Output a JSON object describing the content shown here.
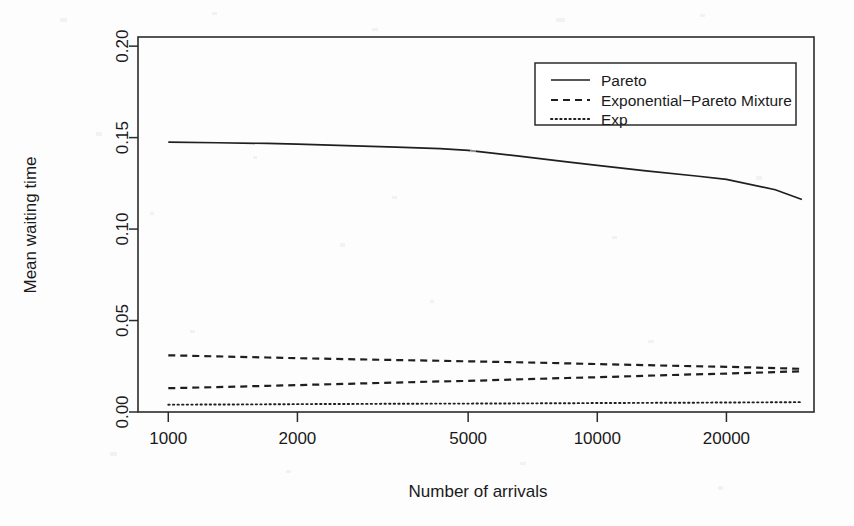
{
  "chart_data": {
    "type": "line",
    "title": "",
    "xlabel": "Number of arrivals",
    "ylabel": "Mean waiting time",
    "xscale": "log",
    "yscale": "linear",
    "xlim": [
      850,
      32000
    ],
    "ylim": [
      0.0,
      0.205
    ],
    "xticks": [
      1000,
      2000,
      5000,
      10000,
      20000
    ],
    "xtick_labels": [
      "1000",
      "2000",
      "5000",
      "10000",
      "20000"
    ],
    "yticks": [
      0.0,
      0.05,
      0.1,
      0.15,
      0.2
    ],
    "ytick_labels": [
      "0.00",
      "0.05",
      "0.10",
      "0.15",
      "0.20"
    ],
    "grid": false,
    "legend_position": "top-right",
    "legend_entries": [
      {
        "label": "Pareto",
        "style": "solid"
      },
      {
        "label": "Exponential−Pareto Mixture",
        "style": "dashed"
      },
      {
        "label": "Exp",
        "style": "dotted"
      }
    ],
    "x": [
      1000,
      1300,
      1700,
      2000,
      2600,
      3400,
      4300,
      5000,
      6500,
      8500,
      10000,
      13000,
      17000,
      20000,
      26000,
      30000
    ],
    "series": [
      {
        "name": "Pareto",
        "style": "solid",
        "values": [
          0.1475,
          0.1472,
          0.1468,
          0.1464,
          0.1456,
          0.1448,
          0.144,
          0.143,
          0.14,
          0.1367,
          0.1348,
          0.1318,
          0.129,
          0.1272,
          0.1215,
          0.1162
        ]
      },
      {
        "name": "Exponential−Pareto Mixture (upper)",
        "style": "dashed",
        "values": [
          0.031,
          0.0304,
          0.0298,
          0.0294,
          0.0289,
          0.0284,
          0.028,
          0.0277,
          0.0272,
          0.0266,
          0.0262,
          0.0256,
          0.025,
          0.0247,
          0.024,
          0.0236
        ]
      },
      {
        "name": "Exponential−Pareto Mixture (lower)",
        "style": "dashed",
        "values": [
          0.013,
          0.0136,
          0.0143,
          0.0147,
          0.0154,
          0.0161,
          0.0167,
          0.017,
          0.0178,
          0.0186,
          0.019,
          0.0198,
          0.0206,
          0.021,
          0.0218,
          0.0223
        ]
      },
      {
        "name": "Exp",
        "style": "dotted",
        "values": [
          0.004,
          0.0041,
          0.0042,
          0.0043,
          0.0044,
          0.0045,
          0.0046,
          0.0046,
          0.0047,
          0.0048,
          0.0049,
          0.005,
          0.0051,
          0.0052,
          0.0053,
          0.0054
        ]
      }
    ]
  }
}
